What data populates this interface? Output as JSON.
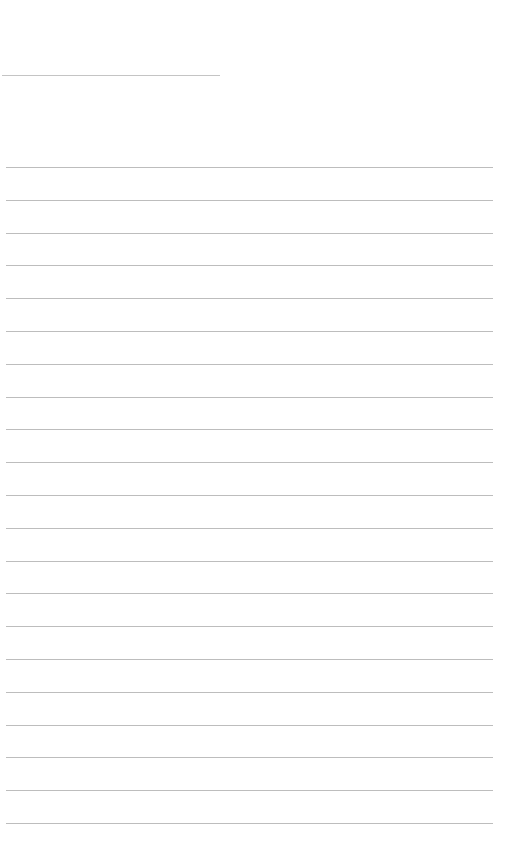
{
  "page": {
    "type": "blank lined notebook page",
    "background_color": "#ffffff",
    "line_color": "#bdbdbd"
  },
  "title_line": {
    "text": "",
    "color": "#c4c4c4"
  },
  "ruled_lines": {
    "count": 21,
    "spacing_px": 32.8,
    "lines": [
      "",
      "",
      "",
      "",
      "",
      "",
      "",
      "",
      "",
      "",
      "",
      "",
      "",
      "",
      "",
      "",
      "",
      "",
      "",
      "",
      ""
    ]
  }
}
